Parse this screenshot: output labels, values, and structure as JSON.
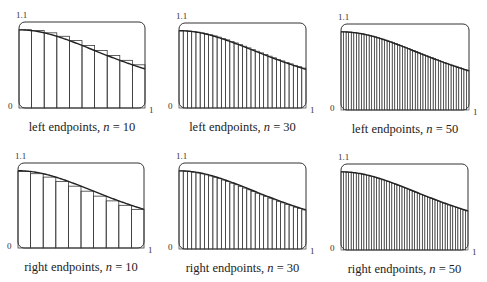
{
  "chart_data": [
    {
      "type": "bar",
      "title": "left endpoints, n = 10",
      "method": "left",
      "n": 10,
      "function_estimated": "1/(1+x^2)",
      "xlim": [
        0,
        1
      ],
      "ylim": [
        0,
        1.1
      ],
      "x_tick_labels": [
        "0",
        "1"
      ],
      "y_tick_labels": [
        "0",
        "1.1"
      ],
      "grid": false
    },
    {
      "type": "bar",
      "title": "left endpoints, n = 30",
      "method": "left",
      "n": 30,
      "function_estimated": "1/(1+x^2)",
      "xlim": [
        0,
        1
      ],
      "ylim": [
        0,
        1.1
      ],
      "x_tick_labels": [
        "0",
        "1"
      ],
      "y_tick_labels": [
        "0",
        "1.1"
      ],
      "grid": false
    },
    {
      "type": "bar",
      "title": "left endpoints, n = 50",
      "method": "left",
      "n": 50,
      "function_estimated": "1/(1+x^2)",
      "xlim": [
        0,
        1
      ],
      "ylim": [
        0,
        1.1
      ],
      "x_tick_labels": [
        "0",
        "1"
      ],
      "y_tick_labels": [
        "0",
        "1.1"
      ],
      "grid": false
    },
    {
      "type": "bar",
      "title": "right endpoints, n = 10",
      "method": "right",
      "n": 10,
      "function_estimated": "1/(1+x^2)",
      "xlim": [
        0,
        1
      ],
      "ylim": [
        0,
        1.1
      ],
      "x_tick_labels": [
        "0",
        "1"
      ],
      "y_tick_labels": [
        "0",
        "1.1"
      ],
      "grid": false
    },
    {
      "type": "bar",
      "title": "right endpoints, n = 30",
      "method": "right",
      "n": 30,
      "function_estimated": "1/(1+x^2)",
      "xlim": [
        0,
        1
      ],
      "ylim": [
        0,
        1.1
      ],
      "x_tick_labels": [
        "0",
        "1"
      ],
      "y_tick_labels": [
        "0",
        "1.1"
      ],
      "grid": false
    },
    {
      "type": "bar",
      "title": "right endpoints, n = 50",
      "method": "right",
      "n": 50,
      "function_estimated": "1/(1+x^2)",
      "xlim": [
        0,
        1
      ],
      "ylim": [
        0,
        1.1
      ],
      "x_tick_labels": [
        "0",
        "1"
      ],
      "y_tick_labels": [
        "0",
        "1.1"
      ],
      "grid": false
    }
  ],
  "panels": [
    {
      "caption_prefix": "left endpoints, ",
      "caption_var": "n",
      "caption_suffix": " = 10",
      "y_top": "1.1",
      "y_bottom": "0",
      "x_right": "1",
      "method": "left",
      "n": 10,
      "box": [
        19,
        22,
        126,
        86
      ]
    },
    {
      "caption_prefix": "left endpoints, ",
      "caption_var": "n",
      "caption_suffix": " = 30",
      "y_top": "1.1",
      "y_bottom": "0",
      "x_right": "1",
      "method": "left",
      "n": 30,
      "box": [
        179,
        23,
        127,
        85
      ]
    },
    {
      "caption_prefix": "left endpoints, ",
      "caption_var": "n",
      "caption_suffix": " = 50",
      "y_top": "1.1",
      "y_bottom": "0",
      "x_right": "1",
      "method": "left",
      "n": 50,
      "box": [
        341,
        24,
        128,
        86
      ]
    },
    {
      "caption_prefix": "right endpoints, ",
      "caption_var": "n",
      "caption_suffix": " = 10",
      "y_top": "1.1",
      "y_bottom": "0",
      "x_right": "1",
      "method": "right",
      "n": 10,
      "box": [
        18,
        163,
        126,
        85
      ]
    },
    {
      "caption_prefix": "right endpoints, ",
      "caption_var": "n",
      "caption_suffix": " = 30",
      "y_top": "1.1",
      "y_bottom": "0",
      "x_right": "1",
      "method": "right",
      "n": 30,
      "box": [
        179,
        163,
        127,
        86
      ]
    },
    {
      "caption_prefix": "right endpoints, ",
      "caption_var": "n",
      "caption_suffix": " = 50",
      "y_top": "1.1",
      "y_bottom": "0",
      "x_right": "1",
      "method": "right",
      "n": 50,
      "box": [
        341,
        164,
        127,
        86
      ]
    }
  ],
  "colors": {
    "stroke": "#222222",
    "bar_stroke": "#3a3a3a",
    "frame": "#333333",
    "background": "#ffffff"
  }
}
